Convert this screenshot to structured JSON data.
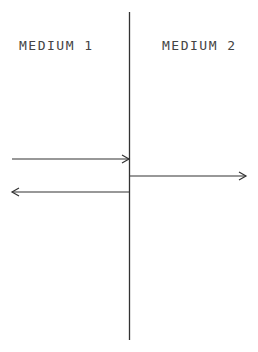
{
  "diagram": {
    "labels": {
      "medium1": "MEDIUM 1",
      "medium2": "MEDIUM 2"
    },
    "boundary": {
      "x": 129,
      "y1": 12,
      "y2": 340
    },
    "arrows": [
      {
        "name": "incident-wave",
        "x1": 12,
        "x2": 129,
        "y": 159,
        "direction": "right"
      },
      {
        "name": "transmitted-wave",
        "x1": 130,
        "x2": 246,
        "y": 176,
        "direction": "right"
      },
      {
        "name": "reflected-wave",
        "x1": 129,
        "x2": 12,
        "y": 192,
        "direction": "left"
      }
    ],
    "colors": {
      "line": "#333333",
      "text": "#444444"
    }
  }
}
